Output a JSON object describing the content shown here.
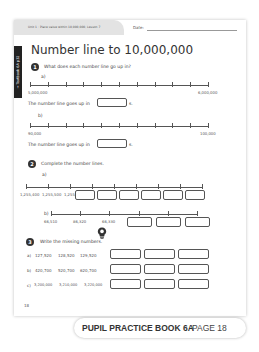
{
  "header": {
    "unit_text": "Unit 1 : Place value within 10,000,000, Lesson 7",
    "date_label": "Date:",
    "side_tab": "→ Textbook 6A p32",
    "title": "Number line to 10,000,000"
  },
  "q1": {
    "number": "1",
    "prompt": "What does each number line go up in?",
    "a": {
      "label": "a)",
      "start": "5,000,000",
      "end": "6,000,000",
      "sentence": "The number line goes up in",
      "suffix": "s."
    },
    "b": {
      "label": "b)",
      "start": "90,000",
      "end": "100,000",
      "sentence": "The number line goes up in",
      "suffix": "s."
    }
  },
  "q2": {
    "number": "2",
    "prompt": "Complete the number lines.",
    "a": {
      "label": "a)",
      "given": [
        "1,255,400",
        "1,255,500",
        "1,255,600"
      ],
      "blank_count": 6
    },
    "b": {
      "label": "b)",
      "given": [
        "66,510",
        "86,320",
        "66,330"
      ],
      "blank_count": 3
    }
  },
  "q3": {
    "number": "3",
    "prompt": "Write the missing numbers.",
    "icon": "lightbulb-icon",
    "rows": [
      {
        "label": "a)",
        "values": [
          "127,520",
          "128,520",
          "129,520"
        ]
      },
      {
        "label": "b)",
        "values": [
          "420,700",
          "520,700",
          "620,700"
        ]
      },
      {
        "label": "c)",
        "values": [
          "3,200,000",
          "3,210,000",
          "3,220,000"
        ]
      }
    ]
  },
  "footer": {
    "page_number": "18",
    "banner_book": "PUPIL PRACTICE BOOK 6A",
    "banner_page": "PAGE 18"
  }
}
